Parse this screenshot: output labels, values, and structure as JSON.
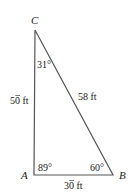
{
  "diagram": {
    "type": "triangle",
    "stroke_color": "#555555",
    "text_color": "#222222",
    "vertices": {
      "A": {
        "label": "A",
        "angle": "89°"
      },
      "B": {
        "label": "B",
        "angle": "60°"
      },
      "C": {
        "label": "C",
        "angle": "31°"
      }
    },
    "sides": {
      "AC": {
        "value_prefix": "5",
        "value_barred_digit": "0",
        "unit": " ft",
        "full_text": "50̄ ft"
      },
      "BC": {
        "full_text": "58 ft"
      },
      "AB": {
        "value_prefix": "3",
        "value_barred_digit": "0",
        "unit": " ft",
        "full_text": "30̄ ft"
      }
    }
  }
}
